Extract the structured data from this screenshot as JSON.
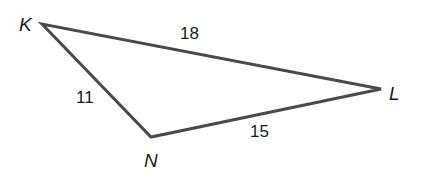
{
  "diagram": {
    "type": "triangle",
    "vertices": {
      "K": {
        "label": "K",
        "x": 42,
        "y": 24
      },
      "N": {
        "label": "N",
        "x": 151,
        "y": 137
      },
      "L": {
        "label": "L",
        "x": 381,
        "y": 89
      }
    },
    "sides": {
      "KL": {
        "label": "18"
      },
      "KN": {
        "label": "11"
      },
      "NL": {
        "label": "15"
      }
    },
    "colors": {
      "stroke": "#4a4a4a",
      "text": "#1a1a1a",
      "background": "#ffffff"
    }
  }
}
